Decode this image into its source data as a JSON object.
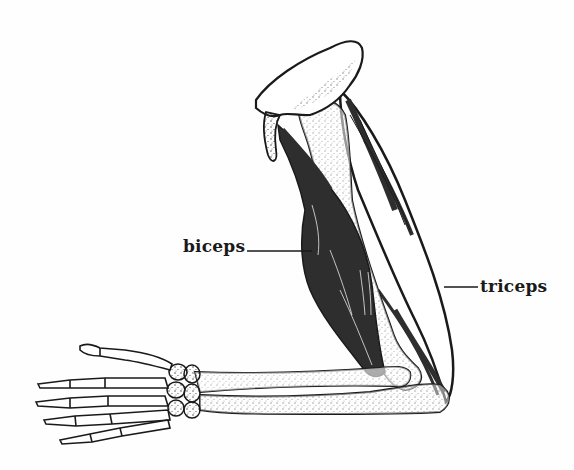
{
  "diagram": {
    "labels": [
      {
        "id": "biceps",
        "text": "biceps",
        "leader_line": {
          "x1": 247,
          "y1": 251,
          "x2": 312,
          "y2": 251
        }
      },
      {
        "id": "triceps",
        "text": "triceps",
        "leader_line": {
          "x1": 444,
          "y1": 287,
          "x2": 478,
          "y2": 287
        }
      }
    ],
    "parts": [
      {
        "name": "scapula",
        "style": "outlined-stippled"
      },
      {
        "name": "humerus",
        "style": "outlined-stippled"
      },
      {
        "name": "biceps",
        "style": "dark-filled"
      },
      {
        "name": "triceps",
        "style": "outlined-striated"
      },
      {
        "name": "radius",
        "style": "outlined-stippled"
      },
      {
        "name": "ulna",
        "style": "outlined-stippled"
      },
      {
        "name": "carpals",
        "style": "outlined-stippled"
      },
      {
        "name": "metacarpals",
        "style": "outlined"
      },
      {
        "name": "phalanges",
        "style": "outlined"
      }
    ],
    "colors": {
      "background": "#fefefe",
      "ink": "#1a1a1a",
      "muscle_fill": "#2e2e2e"
    }
  }
}
